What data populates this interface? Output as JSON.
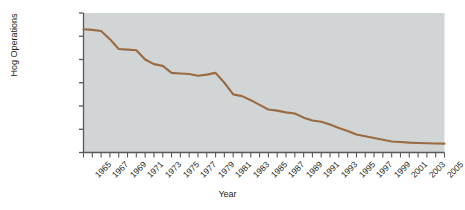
{
  "chart_data": {
    "type": "line",
    "title": "",
    "xlabel": "Year",
    "ylabel": "Hog Operations",
    "xlim": [
      1965,
      2006
    ],
    "ylim": [
      0,
      1200000
    ],
    "grid": false,
    "legend": null,
    "line_color": "#9a6b43",
    "plot_background": "#d2d5d5",
    "y_ticks": [
      0,
      200000,
      400000,
      600000,
      800000,
      1000000,
      1200000
    ],
    "y_tick_labels": [
      "0",
      "200,000",
      "400,000",
      "600,000",
      "800,000",
      "1,000,000",
      "1,200,000"
    ],
    "x_tick_labels": [
      "1965",
      "1967",
      "1969",
      "1971",
      "1973",
      "1975",
      "1977",
      "1979",
      "1981",
      "1983",
      "1985",
      "1987",
      "1989",
      "1991",
      "1993",
      "1995",
      "1997",
      "1999",
      "2001",
      "2003",
      "2005"
    ],
    "x_minor_ticks_every_year": true,
    "x": [
      1965,
      1966,
      1967,
      1968,
      1969,
      1970,
      1971,
      1972,
      1973,
      1974,
      1975,
      1976,
      1977,
      1978,
      1979,
      1980,
      1981,
      1982,
      1983,
      1984,
      1985,
      1986,
      1987,
      1988,
      1989,
      1990,
      1991,
      1992,
      1993,
      1994,
      1995,
      1996,
      1997,
      1998,
      1999,
      2000,
      2001,
      2002,
      2003,
      2004,
      2005,
      2006
    ],
    "values": [
      1060000,
      1055000,
      1045000,
      975000,
      890000,
      885000,
      880000,
      800000,
      760000,
      745000,
      685000,
      680000,
      675000,
      660000,
      670000,
      685000,
      600000,
      500000,
      485000,
      450000,
      410000,
      370000,
      360000,
      345000,
      335000,
      300000,
      275000,
      265000,
      240000,
      210000,
      185000,
      155000,
      140000,
      125000,
      110000,
      95000,
      90000,
      85000,
      82000,
      80000,
      78000,
      76000
    ],
    "series_name": "Hog Operations"
  },
  "figure": {
    "x_axis_title": "Year",
    "y_axis_title": "Hog Operations"
  }
}
